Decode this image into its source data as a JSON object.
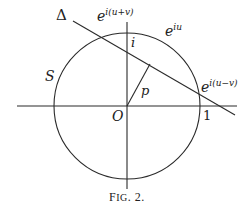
{
  "figure": {
    "caption_prefix": "F",
    "caption_smallcaps": "IG",
    "caption_suffix": ". 2."
  },
  "labels": {
    "delta": "Δ",
    "S": "S",
    "O": "O",
    "p": "p",
    "i": "i",
    "one": "1",
    "e_upv_base": "e",
    "e_upv_exp": "i(u+v)",
    "e_u_base": "e",
    "e_u_exp": "iu",
    "e_umv_base": "e",
    "e_umv_exp": "i(u−v)"
  },
  "geometry": {
    "center": [
      127,
      106
    ],
    "radius": 73,
    "x_axis": [
      [
        17,
        106
      ],
      [
        237,
        106
      ]
    ],
    "y_axis": [
      [
        127,
        22
      ],
      [
        127,
        189
      ]
    ],
    "delta_line": [
      [
        73,
        21
      ],
      [
        235,
        115
      ]
    ],
    "p_segment": [
      [
        127,
        106
      ],
      [
        150,
        64
      ]
    ],
    "stroke_color": "#2a2a2a"
  }
}
